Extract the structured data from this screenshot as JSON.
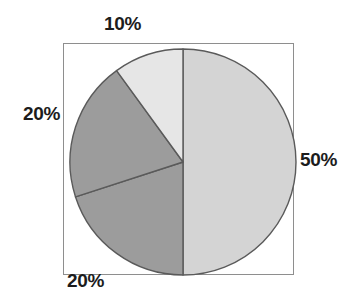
{
  "figure": {
    "background_color": "#ffffff",
    "frame_color": "#8e8e8e"
  },
  "chart_data": {
    "type": "pie",
    "title": "",
    "xlabel": "",
    "ylabel": "",
    "categories": [
      "50%",
      "20%",
      "20%",
      "10%"
    ],
    "values": [
      50,
      20,
      20,
      10
    ],
    "labels": [
      "50%",
      "20%",
      "20%",
      "10%"
    ],
    "label_positions": [
      "right",
      "bottom",
      "left",
      "top"
    ],
    "colors": [
      "#d4d4d4",
      "#9c9c9c",
      "#9c9c9c",
      "#e6e6e6"
    ],
    "start_angle_deg": 0,
    "direction": "clockwise",
    "slice_edge_color": "#5a5a5a",
    "legend": false,
    "grid": false,
    "slices": [
      {
        "label": "50%",
        "value": 50,
        "color": "#d4d4d4",
        "start_deg": 0,
        "end_deg": 180
      },
      {
        "label": "20%",
        "value": 20,
        "color": "#9c9c9c",
        "start_deg": 180,
        "end_deg": 252
      },
      {
        "label": "20%",
        "value": 20,
        "color": "#9c9c9c",
        "start_deg": 252,
        "end_deg": 324
      },
      {
        "label": "10%",
        "value": 10,
        "color": "#e6e6e6",
        "start_deg": 324,
        "end_deg": 360
      }
    ]
  },
  "labels": {
    "top": "10%",
    "left": "20%",
    "right": "50%",
    "bottom": "20%"
  }
}
